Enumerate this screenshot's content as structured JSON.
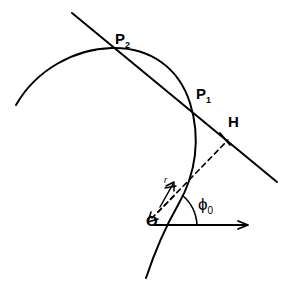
{
  "figure": {
    "background_color": "#ffffff",
    "stroke_color": "#000000",
    "width": 294,
    "height": 293
  },
  "labels": {
    "p2": {
      "base": "P",
      "sub": "2",
      "x": 115,
      "y": 31
    },
    "p1": {
      "base": "P",
      "sub": "1",
      "x": 196,
      "y": 86
    },
    "h": {
      "text": "H",
      "x": 228,
      "y": 114
    },
    "o": {
      "text": "O",
      "x": 146,
      "y": 213
    },
    "phi": {
      "base": "ϕ",
      "sub": "0",
      "x": 198,
      "y": 196
    },
    "r": {
      "text": "r",
      "x": 164,
      "y": 182
    }
  },
  "geometry": {
    "curve": {
      "name": "conic-arc",
      "path": "M 16 105 C 36 70, 74 49, 112 48 C 150 47, 179 68, 190 103 C 201 138, 196 174, 178 205 C 166 226, 154 254, 146 278",
      "stroke_width": 2.0
    },
    "secant_line": {
      "name": "secant-line-through-p1-p2",
      "x1": 72,
      "y1": 13,
      "x2": 277,
      "y2": 182,
      "stroke_width": 2.0
    },
    "dashed_radius": {
      "name": "dashed-line-o-to-h",
      "x1": 158,
      "y1": 212,
      "x2": 228,
      "y2": 140,
      "dash": "5,4",
      "stroke_width": 1.6
    },
    "dashed_back_ray": {
      "name": "dashed-back-ray",
      "x1": 172,
      "y1": 198,
      "x2": 148,
      "y2": 222,
      "dash": "5,4",
      "stroke_width": 1.6
    },
    "axis_arrow": {
      "name": "horizontal-axis-arrow",
      "x1": 155,
      "y1": 225,
      "x2": 248,
      "y2": 225,
      "stroke_width": 2.0
    },
    "perp_tick_at_h": {
      "name": "perpendicular-tick-at-h",
      "x1": 219,
      "y1": 134,
      "x2": 230,
      "y2": 146,
      "stroke_width": 1.8
    },
    "radius_arrow": {
      "name": "radius-vector-arrow",
      "x1": 160,
      "y1": 207,
      "x2": 174,
      "y2": 182,
      "stroke_width": 1.6
    },
    "back_arrowhead": {
      "name": "back-ray-arrowhead",
      "x": 148,
      "y": 222
    },
    "angle_arc": {
      "name": "angle-arc-phi-zero",
      "path": "M 199 225 A 44 44 0 0 0 183 194",
      "stroke_width": 1.6
    }
  }
}
